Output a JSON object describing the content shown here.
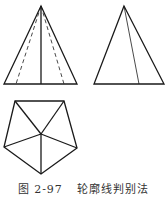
{
  "caption": {
    "figure_number": "图 2-97",
    "title": "轮廓线判别法"
  },
  "figures": {
    "left_triangle": {
      "apex": [
        41,
        6
      ],
      "base_left": [
        4,
        84
      ],
      "base_right": [
        77,
        84
      ],
      "center_foot": [
        41,
        84
      ],
      "dashed_feet": [
        [
          16,
          84
        ],
        [
          64,
          84
        ]
      ]
    },
    "right_triangle": {
      "apex": [
        124,
        6
      ],
      "base_left": [
        94,
        84
      ],
      "base_right": [
        164,
        84
      ],
      "inner_foot": [
        139,
        84
      ]
    },
    "pentagon": {
      "vertices": [
        [
          15,
          101
        ],
        [
          64,
          101
        ],
        [
          77,
          148
        ],
        [
          41,
          174
        ],
        [
          4,
          147
        ]
      ],
      "center": [
        41,
        134
      ]
    }
  },
  "colors": {
    "line": "#1a1a1a"
  }
}
